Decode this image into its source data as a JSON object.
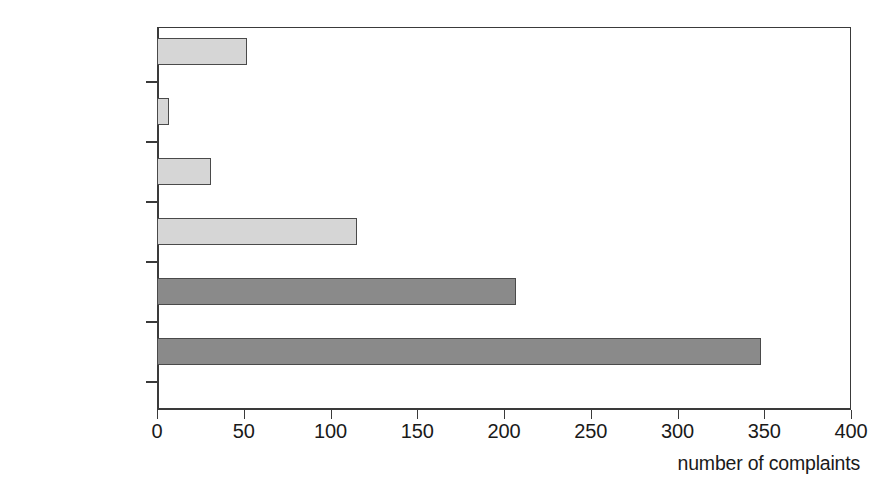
{
  "chart_data": {
    "type": "bar",
    "orientation": "horizontal",
    "title": "",
    "subtitle": "",
    "xlabel": "number of complaints",
    "ylabel": "",
    "categories": [
      "1948–59",
      "1960–69",
      "1970–79",
      "1980–89",
      "1948–89 total",
      "1995–2004"
    ],
    "values": [
      52,
      7,
      31,
      115,
      207,
      348
    ],
    "series": [
      {
        "name": "number of complaints",
        "values": [
          52,
          7,
          31,
          115,
          207,
          348
        ]
      }
    ],
    "bar_styles": [
      "light",
      "light",
      "light",
      "light",
      "dark",
      "dark"
    ],
    "xlim": [
      0,
      400
    ],
    "xticks": [
      0,
      50,
      100,
      150,
      200,
      250,
      300,
      350,
      400
    ],
    "xtick_labels": [
      "0",
      "50",
      "100",
      "150",
      "200",
      "250",
      "300",
      "350",
      "400"
    ],
    "grid": false,
    "legend": null,
    "colors": {
      "light_bar": "#d6d6d6",
      "dark_bar": "#8a8a8a",
      "bar_outline": "#4a4a4a",
      "axis": "#3a3a3a",
      "text": "#1a1a1a",
      "background": "#ffffff"
    }
  }
}
